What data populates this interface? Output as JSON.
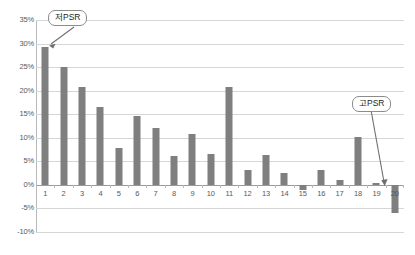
{
  "chart_data": {
    "type": "bar",
    "title": "",
    "subtitle": "",
    "xlabel": "",
    "ylabel": "",
    "categories": [
      "1",
      "2",
      "3",
      "4",
      "5",
      "6",
      "7",
      "8",
      "9",
      "10",
      "11",
      "12",
      "13",
      "14",
      "15",
      "16",
      "17",
      "18",
      "19",
      "20"
    ],
    "values": [
      29.3,
      25.0,
      20.8,
      16.5,
      7.9,
      14.6,
      12.0,
      6.1,
      10.9,
      6.6,
      20.7,
      3.1,
      6.3,
      2.6,
      -1.0,
      3.2,
      1.1,
      10.2,
      0.3,
      -6.0
    ],
    "ylim": [
      -10,
      35
    ],
    "ytick_values": [
      35,
      30,
      25,
      20,
      15,
      10,
      5,
      0,
      -5,
      -10
    ],
    "ytick_labels": [
      "35%",
      "30%",
      "25%",
      "20%",
      "15%",
      "10%",
      "5%",
      "0%",
      "-5%",
      "-10%"
    ],
    "grid": true,
    "legend": "none",
    "bar_color": "#7f7f7f",
    "gridline_color": "#d6d6d6",
    "axis_color": "#b9b9b9",
    "annotations": [
      {
        "name": "low-psr",
        "label": "저PSR",
        "points_to_category": "1",
        "points_to_value": 29.3
      },
      {
        "name": "high-psr",
        "label": "고PSR",
        "points_to_category": "20",
        "points_to_value": -6.0
      }
    ]
  },
  "callouts": {
    "low_psr_label": "저PSR",
    "high_psr_label": "고PSR"
  }
}
